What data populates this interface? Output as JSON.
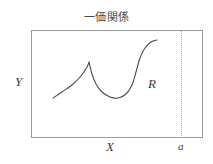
{
  "figure": {
    "title": "一価関係",
    "width": 213,
    "height": 164,
    "background_color": "#ffffff"
  },
  "frame": {
    "border_color": "#9a9a9a",
    "left": 31,
    "top": 30,
    "width": 172,
    "height": 108
  },
  "labels": {
    "y_axis": "Y",
    "x_axis": "X",
    "region": "R",
    "point_a": "a"
  },
  "marker_line": {
    "style": "dotted",
    "color": "#b0b0b0",
    "x": 181,
    "label": "a"
  },
  "chart_data": {
    "type": "line",
    "title": "一価関係",
    "xlabel": "X",
    "ylabel": "Y",
    "grid": false,
    "legend": null,
    "annotations": [
      {
        "text": "R",
        "x": 148,
        "y": 82
      },
      {
        "text": "a",
        "x": 181,
        "y": 147
      }
    ],
    "series": [
      {
        "name": "single-valued curve",
        "color": "#4a4a4a",
        "points": [
          {
            "x": 53,
            "y": 98
          },
          {
            "x": 62,
            "y": 92
          },
          {
            "x": 72,
            "y": 85
          },
          {
            "x": 81,
            "y": 76
          },
          {
            "x": 87,
            "y": 67
          },
          {
            "x": 89,
            "y": 62
          },
          {
            "x": 92,
            "y": 74
          },
          {
            "x": 96,
            "y": 84
          },
          {
            "x": 102,
            "y": 92
          },
          {
            "x": 110,
            "y": 97
          },
          {
            "x": 118,
            "y": 98
          },
          {
            "x": 126,
            "y": 94
          },
          {
            "x": 132,
            "y": 85
          },
          {
            "x": 136,
            "y": 72
          },
          {
            "x": 140,
            "y": 58
          },
          {
            "x": 145,
            "y": 48
          },
          {
            "x": 151,
            "y": 42
          },
          {
            "x": 157,
            "y": 40
          }
        ]
      }
    ],
    "xlim": [
      31,
      203
    ],
    "ylim": [
      138,
      30
    ]
  }
}
